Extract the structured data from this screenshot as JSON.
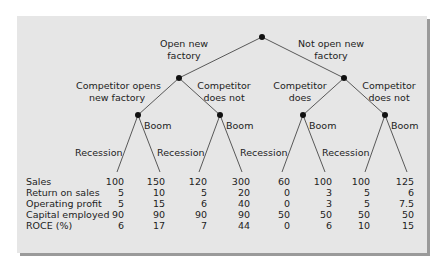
{
  "tree": {
    "root_branches": [
      {
        "label_line1": "Open new",
        "label_line2": "factory"
      },
      {
        "label_line1": "Not open new",
        "label_line2": "factory"
      }
    ],
    "competitor_branches": [
      {
        "label_line1": "Competitor opens",
        "label_line2": "new factory"
      },
      {
        "label_line1": "Competitor",
        "label_line2": "does not"
      },
      {
        "label_line1": "Competitor",
        "label_line2": "does"
      },
      {
        "label_line1": "Competitor",
        "label_line2": "does not"
      }
    ],
    "economy_branches": {
      "boom": "Boom",
      "recession": "Recession"
    }
  },
  "table": {
    "row_labels": [
      "Sales",
      "Return on sales",
      "Operating profit",
      "Capital employed",
      "ROCE (%)"
    ],
    "columns": [
      [
        "100",
        "5",
        "5",
        "90",
        "6"
      ],
      [
        "150",
        "10",
        "15",
        "90",
        "17"
      ],
      [
        "120",
        "5",
        "6",
        "90",
        "7"
      ],
      [
        "300",
        "20",
        "40",
        "90",
        "44"
      ],
      [
        "60",
        "0",
        "0",
        "50",
        "0"
      ],
      [
        "100",
        "3",
        "3",
        "50",
        "6"
      ],
      [
        "100",
        "5",
        "5",
        "50",
        "10"
      ],
      [
        "125",
        "6",
        "7.5",
        "50",
        "15"
      ]
    ]
  }
}
